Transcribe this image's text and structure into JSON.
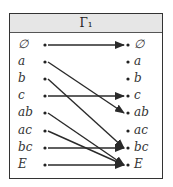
{
  "title": "Γ₁",
  "elements": [
    "∅",
    "a",
    "b",
    "c",
    "ab",
    "ac",
    "bc",
    "E"
  ],
  "mapping": [
    {
      "from": "∅",
      "to": "∅"
    },
    {
      "from": "a",
      "to": "ab"
    },
    {
      "from": "b",
      "to": "bc"
    },
    {
      "from": "c",
      "to": "c"
    },
    {
      "from": "ab",
      "to": "E"
    },
    {
      "from": "ac",
      "to": "E"
    },
    {
      "from": "bc",
      "to": "bc"
    },
    {
      "from": "E",
      "to": "E"
    }
  ],
  "colors": {
    "line": "#2a2a2a",
    "header_bg": "#e6e6e6"
  }
}
